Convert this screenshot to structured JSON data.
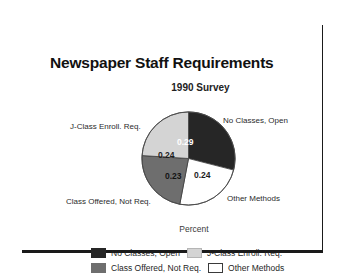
{
  "chart_data": {
    "type": "pie",
    "title": "Newspaper Staff Requirements",
    "subtitle": "1990 Survey",
    "xlabel": "Percent",
    "ylabel": "",
    "legend_position": "bottom",
    "grid": false,
    "categories": [
      "No Classes, Open",
      "Other Methods",
      "Class Offered, Not Req.",
      "J-Class Enroll. Req."
    ],
    "values": [
      0.29,
      0.24,
      0.23,
      0.24
    ],
    "value_labels": [
      "0.29",
      "0.24",
      "0.23",
      "0.24"
    ],
    "colors": [
      "#262626",
      "#ffffff",
      "#6e6e6e",
      "#d4d4d4"
    ],
    "slices": [
      {
        "label": "No Classes, Open",
        "value": 0.29,
        "value_label": "0.29",
        "color": "#262626",
        "start_deg": 0,
        "end_deg": 104.4
      },
      {
        "label": "Other Methods",
        "value": 0.24,
        "value_label": "0.24",
        "color": "#ffffff",
        "start_deg": 104.4,
        "end_deg": 190.8
      },
      {
        "label": "Class Offered, Not Req.",
        "value": 0.23,
        "value_label": "0.23",
        "color": "#6e6e6e",
        "start_deg": 190.8,
        "end_deg": 273.6
      },
      {
        "label": "J-Class Enroll. Req.",
        "value": 0.24,
        "value_label": "0.24",
        "color": "#d4d4d4",
        "start_deg": 273.6,
        "end_deg": 360
      }
    ]
  },
  "header": {
    "title": "Newspaper Staff Requirements",
    "subtitle": "1990 Survey"
  },
  "axis": {
    "caption": "Percent"
  },
  "callouts": {
    "no_classes": "No Classes, Open",
    "jclass": "J-Class Enroll. Req.",
    "class_offered": "Class Offered, Not Req.",
    "other_methods": "Other Methods"
  },
  "slice_values": {
    "no_classes": "0.29",
    "jclass": "0.24",
    "class_offered": "0.23",
    "other_methods": "0.24"
  },
  "legend": {
    "rows": [
      [
        {
          "label": "No Classes, Open",
          "color": "#262626",
          "border": "#262626"
        },
        {
          "label": "J-Class Enroll. Req.",
          "color": "#d4d4d4",
          "border": "#b5b5b5"
        }
      ],
      [
        {
          "label": "Class Offered, Not Req.",
          "color": "#6e6e6e",
          "border": "#6e6e6e"
        },
        {
          "label": "Other Methods",
          "color": "#ffffff",
          "border": "#3a3a3a"
        }
      ]
    ]
  }
}
